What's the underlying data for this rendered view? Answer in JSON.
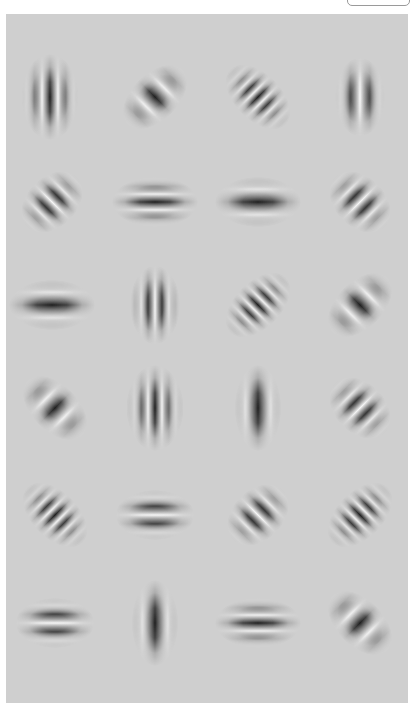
{
  "title": "",
  "top_button": {
    "label": ""
  },
  "panel": {
    "background": "#cfcfcf",
    "rows": 6,
    "cols": 4
  },
  "patches": [
    {
      "row": 1,
      "col": 1,
      "cx": 50,
      "cy": 97,
      "angle": 0,
      "lambda": 16,
      "sx": 16,
      "sy": 24,
      "phase": "dark-center"
    },
    {
      "row": 1,
      "col": 2,
      "cx": 155,
      "cy": 97,
      "angle": -45,
      "lambda": 26,
      "sx": 22,
      "sy": 13,
      "phase": "dark-center"
    },
    {
      "row": 1,
      "col": 3,
      "cx": 258,
      "cy": 97,
      "angle": 45,
      "lambda": 12,
      "sx": 22,
      "sy": 13,
      "phase": "dark-center"
    },
    {
      "row": 1,
      "col": 4,
      "cx": 360,
      "cy": 97,
      "angle": 0,
      "lambda": 20,
      "sx": 14,
      "sy": 22,
      "phase": "light-center"
    },
    {
      "row": 2,
      "col": 1,
      "cx": 52,
      "cy": 202,
      "angle": -45,
      "lambda": 16,
      "sx": 20,
      "sy": 14,
      "phase": "light-center"
    },
    {
      "row": 2,
      "col": 2,
      "cx": 155,
      "cy": 202,
      "angle": 90,
      "lambda": 16,
      "sx": 14,
      "sy": 24,
      "phase": "dark-center"
    },
    {
      "row": 2,
      "col": 3,
      "cx": 258,
      "cy": 202,
      "angle": 90,
      "lambda": 26,
      "sx": 14,
      "sy": 24,
      "phase": "dark-center"
    },
    {
      "row": 2,
      "col": 4,
      "cx": 360,
      "cy": 202,
      "angle": 45,
      "lambda": 16,
      "sx": 20,
      "sy": 14,
      "phase": "light-center"
    },
    {
      "row": 3,
      "col": 1,
      "cx": 52,
      "cy": 305,
      "angle": 90,
      "lambda": 26,
      "sx": 14,
      "sy": 24,
      "phase": "dark-center"
    },
    {
      "row": 3,
      "col": 2,
      "cx": 155,
      "cy": 305,
      "angle": 0,
      "lambda": 14,
      "sx": 14,
      "sy": 22,
      "phase": "light-center"
    },
    {
      "row": 3,
      "col": 3,
      "cx": 258,
      "cy": 305,
      "angle": -45,
      "lambda": 12,
      "sx": 22,
      "sy": 13,
      "phase": "dark-center"
    },
    {
      "row": 3,
      "col": 4,
      "cx": 360,
      "cy": 305,
      "angle": -45,
      "lambda": 26,
      "sx": 22,
      "sy": 13,
      "phase": "dark-center"
    },
    {
      "row": 4,
      "col": 1,
      "cx": 55,
      "cy": 408,
      "angle": 45,
      "lambda": 26,
      "sx": 22,
      "sy": 13,
      "phase": "dark-center"
    },
    {
      "row": 4,
      "col": 2,
      "cx": 155,
      "cy": 408,
      "angle": 0,
      "lambda": 14,
      "sx": 16,
      "sy": 24,
      "phase": "dark-center"
    },
    {
      "row": 4,
      "col": 3,
      "cx": 258,
      "cy": 408,
      "angle": 0,
      "lambda": 26,
      "sx": 13,
      "sy": 24,
      "phase": "dark-center"
    },
    {
      "row": 4,
      "col": 4,
      "cx": 360,
      "cy": 408,
      "angle": 45,
      "lambda": 16,
      "sx": 20,
      "sy": 14,
      "phase": "light-center"
    },
    {
      "row": 5,
      "col": 1,
      "cx": 55,
      "cy": 515,
      "angle": 45,
      "lambda": 12,
      "sx": 22,
      "sy": 13,
      "phase": "dark-center"
    },
    {
      "row": 5,
      "col": 2,
      "cx": 155,
      "cy": 515,
      "angle": 90,
      "lambda": 18,
      "sx": 14,
      "sy": 22,
      "phase": "light-center"
    },
    {
      "row": 5,
      "col": 3,
      "cx": 258,
      "cy": 515,
      "angle": -45,
      "lambda": 16,
      "sx": 20,
      "sy": 14,
      "phase": "light-center"
    },
    {
      "row": 5,
      "col": 4,
      "cx": 360,
      "cy": 515,
      "angle": -45,
      "lambda": 12,
      "sx": 22,
      "sy": 13,
      "phase": "dark-center"
    },
    {
      "row": 6,
      "col": 1,
      "cx": 55,
      "cy": 623,
      "angle": 90,
      "lambda": 18,
      "sx": 14,
      "sy": 22,
      "phase": "light-center"
    },
    {
      "row": 6,
      "col": 2,
      "cx": 155,
      "cy": 623,
      "angle": 0,
      "lambda": 26,
      "sx": 13,
      "sy": 24,
      "phase": "dark-center"
    },
    {
      "row": 6,
      "col": 3,
      "cx": 258,
      "cy": 623,
      "angle": 90,
      "lambda": 16,
      "sx": 14,
      "sy": 24,
      "phase": "dark-center"
    },
    {
      "row": 6,
      "col": 4,
      "cx": 360,
      "cy": 623,
      "angle": 45,
      "lambda": 26,
      "sx": 22,
      "sy": 13,
      "phase": "dark-center"
    }
  ]
}
